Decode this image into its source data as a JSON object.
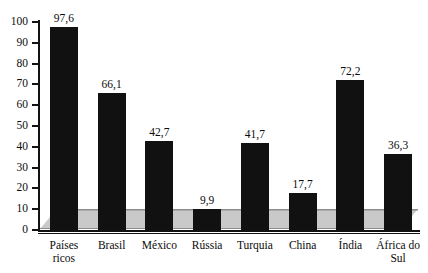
{
  "chart_data": {
    "type": "bar",
    "title": "",
    "subtitle": "",
    "xlabel": "",
    "ylabel": "",
    "ylim": [
      0,
      100
    ],
    "ytick_step": 10,
    "yticks": [
      "100",
      "90",
      "80",
      "70",
      "60",
      "50",
      "40",
      "30",
      "20",
      "10",
      "0"
    ],
    "grid": false,
    "legend": "none",
    "decimal_separator": ",",
    "bar_color": "#111111",
    "floor_color": "#c9c9c9",
    "axis_color": "#121212",
    "categories": [
      "Países ricos",
      "Brasil",
      "México",
      "Rússia",
      "Turquia",
      "China",
      "Índia",
      "África do Sul"
    ],
    "category_lines": [
      [
        "Países",
        "ricos"
      ],
      [
        "Brasil"
      ],
      [
        "México"
      ],
      [
        "Rússia"
      ],
      [
        "Turquia"
      ],
      [
        "China"
      ],
      [
        "Índia"
      ],
      [
        "África do",
        "Sul"
      ]
    ],
    "values": [
      97.6,
      66.1,
      42.7,
      9.9,
      41.7,
      17.7,
      72.2,
      36.3
    ],
    "value_labels": [
      "97,6",
      "66,1",
      "42,7",
      "9,9",
      "41,7",
      "17,7",
      "72,2",
      "36,3"
    ]
  }
}
